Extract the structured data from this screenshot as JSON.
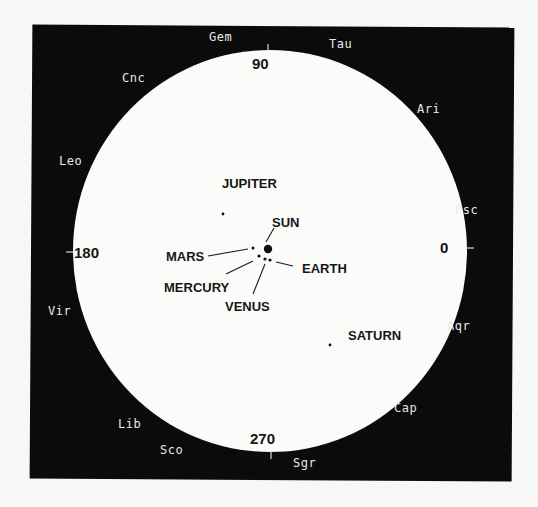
{
  "diagram": {
    "frame": {
      "x": 31,
      "y": 26,
      "width": 482,
      "height": 454,
      "color": "#0b0b0b"
    },
    "disc": {
      "cx": 270,
      "cy": 251,
      "rx": 197,
      "ry": 201,
      "color": "#fbfbfa"
    },
    "degree_ticks": [
      {
        "label": "90",
        "angle": 90,
        "tick": {
          "x1": 268,
          "y1": 44,
          "x2": 268,
          "y2": 51
        },
        "text_x": 252,
        "text_y": 56
      },
      {
        "label": "180",
        "angle": 180,
        "tick": {
          "x1": 66,
          "y1": 252,
          "x2": 73,
          "y2": 252
        },
        "text_x": 74,
        "text_y": 245
      },
      {
        "label": "0",
        "angle": 0,
        "tick": {
          "x1": 466,
          "y1": 248,
          "x2": 474,
          "y2": 248
        },
        "text_x": 440,
        "text_y": 240
      },
      {
        "label": "270",
        "angle": 270,
        "tick": {
          "x1": 271,
          "y1": 451,
          "x2": 271,
          "y2": 459
        },
        "text_x": 250,
        "text_y": 431
      }
    ],
    "constellations": [
      {
        "label": "Gem",
        "x": 209,
        "y": 31
      },
      {
        "label": "Tau",
        "x": 329,
        "y": 38
      },
      {
        "label": "Cnc",
        "x": 122,
        "y": 72
      },
      {
        "label": "Ari",
        "x": 417,
        "y": 103
      },
      {
        "label": "Leo",
        "x": 59,
        "y": 155
      },
      {
        "label": "Psc",
        "x": 455,
        "y": 204
      },
      {
        "label": "Vir",
        "x": 48,
        "y": 305
      },
      {
        "label": "Aqr",
        "x": 447,
        "y": 320
      },
      {
        "label": "Cap",
        "x": 394,
        "y": 402
      },
      {
        "label": "Lib",
        "x": 118,
        "y": 418
      },
      {
        "label": "Sco",
        "x": 160,
        "y": 444
      },
      {
        "label": "Sgr",
        "x": 293,
        "y": 457
      }
    ],
    "bodies": [
      {
        "name": "SUN",
        "x": 268,
        "y": 249,
        "r": 4.2,
        "label_x": 272,
        "label_y": 216,
        "leader": [
          274,
          228,
          266,
          242
        ]
      },
      {
        "name": "MARS",
        "x": 253,
        "y": 248,
        "r": 1.5,
        "label_x": 166,
        "label_y": 250,
        "leader": [
          208,
          256,
          248,
          249
        ]
      },
      {
        "name": "MERCURY",
        "x": 259,
        "y": 256,
        "r": 1.6,
        "label_x": 164,
        "label_y": 281,
        "leader": [
          226,
          274,
          253,
          261
        ]
      },
      {
        "name": "VENUS",
        "x": 265,
        "y": 259,
        "r": 1.6,
        "label_x": 225,
        "label_y": 300,
        "leader": [
          253,
          294,
          265,
          264
        ]
      },
      {
        "name": "EARTH",
        "x": 270,
        "y": 260,
        "r": 1.6,
        "label_x": 302,
        "label_y": 262,
        "leader": [
          293,
          266,
          276,
          262
        ]
      },
      {
        "name": "JUPITER",
        "x": 223,
        "y": 214,
        "r": 1.4,
        "label_x": 222,
        "label_y": 177,
        "leader": null
      },
      {
        "name": "SATURN",
        "x": 330,
        "y": 345,
        "r": 1.4,
        "label_x": 348,
        "label_y": 329,
        "leader": null
      }
    ]
  }
}
